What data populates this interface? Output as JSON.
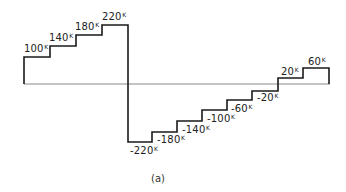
{
  "diagram": {
    "caption": "(a)",
    "unit_superscript": "K",
    "colors": {
      "staircase": "#1a1a1a",
      "baseline": "#888888"
    },
    "positive_staircase": {
      "labels": [
        "100",
        "140",
        "180",
        "220"
      ]
    },
    "negative_staircase": {
      "labels": [
        "-220",
        "-180",
        "-140",
        "-100",
        "-60",
        "-20"
      ]
    },
    "right_positive_steps": {
      "labels": [
        "20",
        "60"
      ]
    }
  }
}
